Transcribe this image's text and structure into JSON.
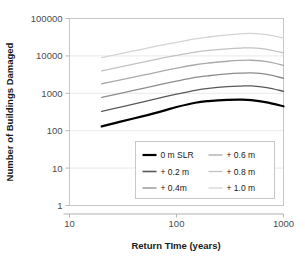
{
  "chart_data": {
    "type": "line",
    "title": "",
    "xlabel": "Return TIme (years)",
    "ylabel": "Number of Buildings Damaged",
    "xscale": "log",
    "yscale": "log",
    "xlim": [
      10,
      1000
    ],
    "ylim": [
      1,
      100000
    ],
    "xticks": [
      "10",
      "100",
      "1000"
    ],
    "xtick_values": [
      10,
      100,
      1000
    ],
    "yticks": [
      "1",
      "10",
      "100",
      "1000",
      "10000",
      "100000"
    ],
    "ytick_values": [
      1,
      10,
      100,
      1000,
      10000,
      100000
    ],
    "grid": "horizontal",
    "legend_position": "inside lower center-right",
    "x": [
      20,
      30,
      50,
      75,
      100,
      150,
      200,
      300,
      400,
      500,
      700,
      1000
    ],
    "series": [
      {
        "name": "0 m SLR",
        "color": "#000000",
        "width": 2.2,
        "values": [
          130,
          175,
          250,
          340,
          430,
          560,
          620,
          670,
          680,
          660,
          570,
          450
        ]
      },
      {
        "name": "+ 0.2 m",
        "color": "#595959",
        "width": 1.3,
        "values": [
          330,
          430,
          600,
          790,
          950,
          1200,
          1350,
          1500,
          1560,
          1580,
          1420,
          1130
        ]
      },
      {
        "name": "+ 0.4m",
        "color": "#8c8c8c",
        "width": 1.3,
        "values": [
          780,
          1000,
          1380,
          1790,
          2120,
          2650,
          2950,
          3300,
          3450,
          3500,
          3200,
          2520
        ]
      },
      {
        "name": "+ 0.6 m",
        "color": "#aaaaaa",
        "width": 1.3,
        "values": [
          1800,
          2300,
          3100,
          4000,
          4700,
          5800,
          6450,
          7200,
          7550,
          7650,
          7000,
          5600
        ]
      },
      {
        "name": "+ 0.8 m",
        "color": "#c2c2c2",
        "width": 1.3,
        "values": [
          4000,
          5100,
          6900,
          8800,
          10300,
          12600,
          14000,
          15500,
          16200,
          16400,
          15000,
          12000
        ]
      },
      {
        "name": "+ 1.0 m",
        "color": "#d4d4d4",
        "width": 1.3,
        "values": [
          9000,
          11500,
          15500,
          19800,
          23000,
          28500,
          32000,
          36500,
          39000,
          40000,
          37000,
          30000
        ]
      }
    ],
    "legend_entries": [
      {
        "label": "0 m SLR",
        "color": "#000000",
        "width": 2.2,
        "column": 0,
        "row": 0
      },
      {
        "label": "+ 0.2 m",
        "color": "#595959",
        "width": 1.6,
        "column": 0,
        "row": 1
      },
      {
        "label": "+ 0.4m",
        "color": "#8c8c8c",
        "width": 1.3,
        "column": 0,
        "row": 2
      },
      {
        "label": "+ 0.6 m",
        "color": "#aaaaaa",
        "width": 1.3,
        "column": 1,
        "row": 0
      },
      {
        "label": "+ 0.8 m",
        "color": "#c2c2c2",
        "width": 1.3,
        "column": 1,
        "row": 1
      },
      {
        "label": "+ 1.0 m",
        "color": "#d4d4d4",
        "width": 1.3,
        "column": 1,
        "row": 2
      }
    ]
  }
}
